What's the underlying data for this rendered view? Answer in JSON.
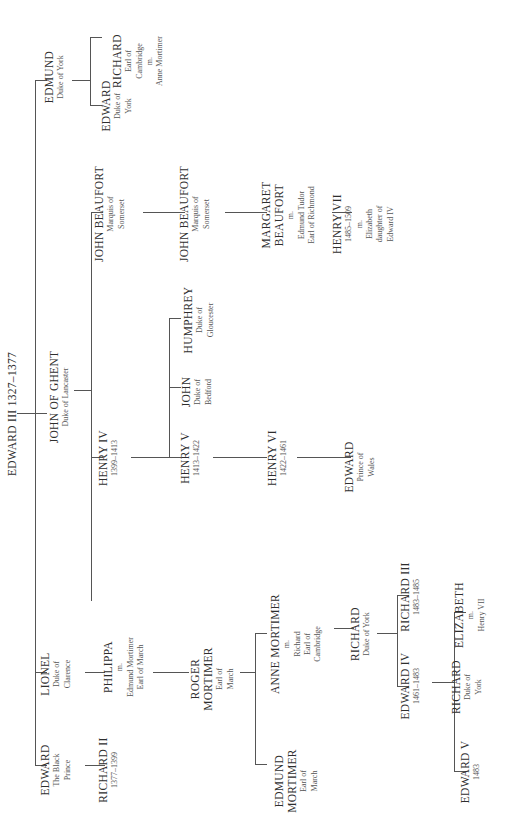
{
  "title": "EDWARD III 1327–1377",
  "nodes": {
    "edward3": {
      "name": "EDWARD III 1327–1377"
    },
    "edmund": {
      "name": "EDMUND",
      "sub": [
        "Duke of York"
      ]
    },
    "john_of_ghent": {
      "name": "JOHN OF GHENT",
      "sub": [
        "Duke of Lancaster"
      ]
    },
    "lionel": {
      "name": "LIONEL",
      "sub": [
        "Duke of",
        "Clarence"
      ]
    },
    "edward_black_prince": {
      "name": "EDWARD",
      "sub": [
        "The Black",
        "Prince"
      ]
    },
    "edward_duke_york": {
      "name": "EDWARD",
      "sub": [
        "Duke of",
        "York"
      ]
    },
    "richard_cambridge": {
      "name": "RICHARD",
      "sub": [
        "Earl of",
        "Cambridge",
        "m.",
        "Anne Mortimer"
      ]
    },
    "john_beaufort_1": {
      "name": "JOHN BEAUFORT",
      "sub": [
        "Marquis of",
        "Somerset"
      ]
    },
    "henry4": {
      "name": "HENRY IV",
      "sub": [
        "1399–1413"
      ]
    },
    "philippa": {
      "name": "PHILIPPA",
      "sub": [
        "m.",
        "Edmund Mortimer",
        "Earl of March"
      ]
    },
    "richard2": {
      "name": "RICHARD II",
      "sub": [
        "1377–1399"
      ]
    },
    "john_beaufort_2": {
      "name": "JOHN BEAUFORT",
      "sub": [
        "Marquis of",
        "Somerset"
      ]
    },
    "humphrey": {
      "name": "HUMPHREY",
      "sub": [
        "Duke of",
        "Gloucester"
      ]
    },
    "john_bedford": {
      "name": "JOHN",
      "sub": [
        "Duke of",
        "Bedford"
      ]
    },
    "henry5": {
      "name": "HENRY V",
      "sub": [
        "1413–1422"
      ]
    },
    "roger_mortimer": {
      "name": "ROGER",
      "name2": "MORTIMER",
      "sub": [
        "Earl of",
        "March"
      ]
    },
    "margaret_beaufort": {
      "name": "MARGARET",
      "name2": "BEAUFORT",
      "sub": [
        "m.",
        "Edmund Tudor",
        "Earl of Richmond"
      ]
    },
    "henry6": {
      "name": "HENRY VI",
      "sub": [
        "1422–1461"
      ]
    },
    "anne_mortimer": {
      "name": "ANNE MORTIMER",
      "sub": [
        "m.",
        "Richard",
        "Earl of",
        "Cambridge"
      ]
    },
    "edmund_mortimer": {
      "name": "EDMUND",
      "name2": "MORTIMER",
      "sub": [
        "Earl of",
        "March"
      ]
    },
    "henry7": {
      "name": "HENRY VII",
      "sub": [
        "1485–1509",
        "m.",
        "Elizabeth",
        "daughter of",
        "Edward IV"
      ]
    },
    "edward_prince_wales": {
      "name": "EDWARD",
      "sub": [
        "Prince of",
        "Wales"
      ]
    },
    "richard_duke_york": {
      "name": "RICHARD",
      "sub": [
        "Duke of York"
      ]
    },
    "richard3": {
      "name": "RICHARD III",
      "sub": [
        "1483–1485"
      ]
    },
    "edward4": {
      "name": "EDWARD IV",
      "sub": [
        "1461–1483"
      ]
    },
    "elizabeth": {
      "name": "ELIZABETH",
      "sub": [
        "m.",
        "Henry VII"
      ]
    },
    "richard_york_young": {
      "name": "RICHARD",
      "sub": [
        "Duke of",
        "York"
      ]
    },
    "edward5": {
      "name": "EDWARD V",
      "sub": [
        "1483"
      ]
    }
  }
}
